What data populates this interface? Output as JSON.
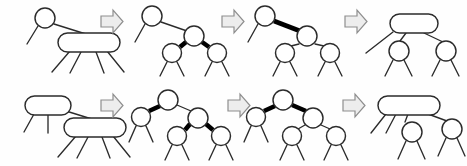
{
  "figure": {
    "background_color": "#fefefe",
    "stroke_color": "#2b2b2b",
    "red_edge_color": "#000000",
    "node_fill_color": "#ffffff",
    "arrow_fill_color": "#ededed",
    "arrow_stroke_color": "#8e8e8e",
    "rows": [
      {
        "row_name": "top-row",
        "description": "Split of a 4-node whose parent is a 2-node",
        "panels": [
          {
            "panel_name": "top-panel-1",
            "caption": "2-3-4 tree: 2-node parent with 4-node child",
            "nodes": [
              {
                "node_name": "parent-2-node",
                "shape": "circle",
                "keys": 1,
                "cx": 45,
                "cy": 18,
                "r": 10
              },
              {
                "node_name": "child-4-node",
                "shape": "rounded-rect",
                "keys": 3,
                "x": 58,
                "y": 33,
                "w": 62,
                "h": 19,
                "rx": 9.5
              }
            ],
            "edges": [
              {
                "edge_name": "parent-left-stub",
                "style": "thin"
              },
              {
                "edge_name": "parent-to-4-node",
                "style": "thin"
              },
              {
                "edge_name": "child-stub-1",
                "style": "thin"
              },
              {
                "edge_name": "child-stub-2",
                "style": "thin"
              },
              {
                "edge_name": "child-stub-3",
                "style": "thin"
              },
              {
                "edge_name": "child-stub-4",
                "style": "thin"
              }
            ]
          },
          {
            "panel_name": "top-panel-2",
            "caption": "Red-black equivalent: middle black node with two red children",
            "nodes": [
              {
                "node_name": "parent-node",
                "shape": "circle",
                "keys": 1,
                "cx": 152,
                "cy": 16,
                "r": 10
              },
              {
                "node_name": "middle-node",
                "shape": "circle",
                "keys": 1,
                "cx": 194,
                "cy": 36,
                "r": 10
              },
              {
                "node_name": "left-red-node",
                "shape": "circle",
                "keys": 1,
                "cx": 172,
                "cy": 53,
                "r": 9.5
              },
              {
                "node_name": "right-red-node",
                "shape": "circle",
                "keys": 1,
                "cx": 217,
                "cy": 53,
                "r": 9.5
              }
            ],
            "edges": [
              {
                "edge_name": "parent-left-stub",
                "style": "thin"
              },
              {
                "edge_name": "parent-to-middle",
                "style": "thin"
              },
              {
                "edge_name": "middle-to-left-red",
                "style": "thick"
              },
              {
                "edge_name": "middle-to-right-red",
                "style": "thick"
              },
              {
                "edge_name": "left-red-stub-1",
                "style": "thin"
              },
              {
                "edge_name": "left-red-stub-2",
                "style": "thin"
              },
              {
                "edge_name": "right-red-stub-1",
                "style": "thin"
              },
              {
                "edge_name": "right-red-stub-2",
                "style": "thin"
              }
            ]
          },
          {
            "panel_name": "top-panel-3",
            "caption": "Color flip: middle node becomes red, children become black",
            "nodes": [
              {
                "node_name": "parent-node",
                "shape": "circle",
                "keys": 1,
                "cx": 265,
                "cy": 16,
                "r": 10
              },
              {
                "node_name": "middle-red-node",
                "shape": "circle",
                "keys": 1,
                "cx": 307,
                "cy": 36,
                "r": 10
              },
              {
                "node_name": "left-child",
                "shape": "circle",
                "keys": 1,
                "cx": 285,
                "cy": 53,
                "r": 9.5
              },
              {
                "node_name": "right-child",
                "shape": "circle",
                "keys": 1,
                "cx": 330,
                "cy": 53,
                "r": 9.5
              }
            ],
            "edges": [
              {
                "edge_name": "parent-left-stub",
                "style": "thin"
              },
              {
                "edge_name": "parent-to-middle",
                "style": "thick"
              },
              {
                "edge_name": "middle-to-left-child",
                "style": "thin"
              },
              {
                "edge_name": "middle-to-right-child",
                "style": "thin"
              },
              {
                "edge_name": "left-child-stub-1",
                "style": "thin"
              },
              {
                "edge_name": "left-child-stub-2",
                "style": "thin"
              },
              {
                "edge_name": "right-child-stub-1",
                "style": "thin"
              },
              {
                "edge_name": "right-child-stub-2",
                "style": "thin"
              }
            ]
          },
          {
            "panel_name": "top-panel-4",
            "caption": "2-3-4 tree result: parent becomes a 3-node with two 2-node children",
            "nodes": [
              {
                "node_name": "parent-3-node",
                "shape": "rounded-rect",
                "keys": 2,
                "x": 390,
                "y": 14,
                "w": 48,
                "h": 19,
                "rx": 9.5
              },
              {
                "node_name": "left-2-node",
                "shape": "circle",
                "keys": 1,
                "cx": 399,
                "cy": 51,
                "r": 10
              },
              {
                "node_name": "right-2-node",
                "shape": "circle",
                "keys": 1,
                "cx": 446,
                "cy": 51,
                "r": 10
              }
            ],
            "edges": [
              {
                "edge_name": "parent-left-stub",
                "style": "thin"
              },
              {
                "edge_name": "parent-to-left-2-node",
                "style": "thin"
              },
              {
                "edge_name": "parent-to-right-2-node",
                "style": "thin"
              },
              {
                "edge_name": "left-2-node-stub-1",
                "style": "thin"
              },
              {
                "edge_name": "left-2-node-stub-2",
                "style": "thin"
              },
              {
                "edge_name": "right-2-node-stub-1",
                "style": "thin"
              },
              {
                "edge_name": "right-2-node-stub-2",
                "style": "thin"
              }
            ]
          }
        ],
        "arrows": [
          {
            "arrow_name": "top-arrow-1",
            "direction": "right",
            "x": 101,
            "y": 10
          },
          {
            "arrow_name": "top-arrow-2",
            "direction": "right",
            "x": 222,
            "y": 10
          },
          {
            "arrow_name": "top-arrow-3",
            "direction": "right",
            "x": 345,
            "y": 10
          }
        ]
      },
      {
        "row_name": "bottom-row",
        "description": "Split of a 4-node whose parent is a 3-node",
        "panels": [
          {
            "panel_name": "bottom-panel-1",
            "caption": "2-3-4 tree: 3-node parent with 4-node child",
            "nodes": [
              {
                "node_name": "parent-3-node",
                "shape": "rounded-rect",
                "keys": 2,
                "x": 25,
                "y": 96,
                "w": 46,
                "h": 19,
                "rx": 9.5
              },
              {
                "node_name": "child-4-node",
                "shape": "rounded-rect",
                "keys": 3,
                "x": 64,
                "y": 118,
                "w": 62,
                "h": 19,
                "rx": 9.5
              }
            ],
            "edges": [
              {
                "edge_name": "parent-stub-1",
                "style": "thin"
              },
              {
                "edge_name": "parent-stub-2",
                "style": "thin"
              },
              {
                "edge_name": "parent-to-4-node",
                "style": "thin"
              },
              {
                "edge_name": "child-stub-1",
                "style": "thin"
              },
              {
                "edge_name": "child-stub-2",
                "style": "thin"
              },
              {
                "edge_name": "child-stub-3",
                "style": "thin"
              },
              {
                "edge_name": "child-stub-4",
                "style": "thin"
              }
            ]
          },
          {
            "panel_name": "bottom-panel-2",
            "caption": "Red-black equivalent: root with one red left child and a black right child holding two red children",
            "nodes": [
              {
                "node_name": "root-node",
                "shape": "circle",
                "keys": 1,
                "cx": 168,
                "cy": 100,
                "r": 10
              },
              {
                "node_name": "left-red-node",
                "shape": "circle",
                "keys": 1,
                "cx": 141,
                "cy": 117,
                "r": 9.5
              },
              {
                "node_name": "right-node",
                "shape": "circle",
                "keys": 1,
                "cx": 198,
                "cy": 118,
                "r": 10
              },
              {
                "node_name": "grandchild-left-red",
                "shape": "circle",
                "keys": 1,
                "cx": 177,
                "cy": 136,
                "r": 9.5
              },
              {
                "node_name": "grandchild-right-red",
                "shape": "circle",
                "keys": 1,
                "cx": 221,
                "cy": 136,
                "r": 9.5
              }
            ],
            "edges": [
              {
                "edge_name": "root-to-left-red",
                "style": "thick"
              },
              {
                "edge_name": "root-to-right",
                "style": "thin"
              },
              {
                "edge_name": "right-to-grandchild-left",
                "style": "thick"
              },
              {
                "edge_name": "right-to-grandchild-right",
                "style": "thick"
              },
              {
                "edge_name": "left-red-stub-1",
                "style": "thin"
              },
              {
                "edge_name": "left-red-stub-2",
                "style": "thin"
              },
              {
                "edge_name": "grandchild-left-stub-1",
                "style": "thin"
              },
              {
                "edge_name": "grandchild-left-stub-2",
                "style": "thin"
              },
              {
                "edge_name": "grandchild-right-stub-1",
                "style": "thin"
              },
              {
                "edge_name": "grandchild-right-stub-2",
                "style": "thin"
              }
            ]
          },
          {
            "panel_name": "bottom-panel-3",
            "caption": "Color flip: both children of root become red",
            "nodes": [
              {
                "node_name": "root-node",
                "shape": "circle",
                "keys": 1,
                "cx": 283,
                "cy": 100,
                "r": 10
              },
              {
                "node_name": "left-red-node",
                "shape": "circle",
                "keys": 1,
                "cx": 256,
                "cy": 117,
                "r": 9.5
              },
              {
                "node_name": "right-red-node",
                "shape": "circle",
                "keys": 1,
                "cx": 313,
                "cy": 118,
                "r": 10
              },
              {
                "node_name": "grandchild-left",
                "shape": "circle",
                "keys": 1,
                "cx": 292,
                "cy": 136,
                "r": 9.5
              },
              {
                "node_name": "grandchild-right",
                "shape": "circle",
                "keys": 1,
                "cx": 336,
                "cy": 136,
                "r": 9.5
              }
            ],
            "edges": [
              {
                "edge_name": "root-to-left-red",
                "style": "thick"
              },
              {
                "edge_name": "root-to-right-red",
                "style": "thick"
              },
              {
                "edge_name": "right-to-grandchild-left",
                "style": "thin"
              },
              {
                "edge_name": "right-to-grandchild-right",
                "style": "thin"
              },
              {
                "edge_name": "left-red-stub-1",
                "style": "thin"
              },
              {
                "edge_name": "left-red-stub-2",
                "style": "thin"
              },
              {
                "edge_name": "grandchild-left-stub-1",
                "style": "thin"
              },
              {
                "edge_name": "grandchild-left-stub-2",
                "style": "thin"
              },
              {
                "edge_name": "grandchild-right-stub-1",
                "style": "thin"
              },
              {
                "edge_name": "grandchild-right-stub-2",
                "style": "thin"
              }
            ]
          },
          {
            "panel_name": "bottom-panel-4",
            "caption": "2-3-4 tree result: parent becomes a 4-node with two 2-node children",
            "nodes": [
              {
                "node_name": "parent-4-node",
                "shape": "rounded-rect",
                "keys": 3,
                "x": 378,
                "y": 96,
                "w": 62,
                "h": 19,
                "rx": 9.5
              },
              {
                "node_name": "left-2-node",
                "shape": "circle",
                "keys": 1,
                "cx": 412,
                "cy": 132,
                "r": 10
              },
              {
                "node_name": "right-2-node",
                "shape": "circle",
                "keys": 1,
                "cx": 452,
                "cy": 129,
                "r": 10
              }
            ],
            "edges": [
              {
                "edge_name": "parent-stub-1",
                "style": "thin"
              },
              {
                "edge_name": "parent-stub-2",
                "style": "thin"
              },
              {
                "edge_name": "parent-stub-3",
                "style": "thin"
              },
              {
                "edge_name": "parent-to-right-2-node",
                "style": "thin"
              },
              {
                "edge_name": "left-2-node-stub-1",
                "style": "thin"
              },
              {
                "edge_name": "left-2-node-stub-2",
                "style": "thin"
              },
              {
                "edge_name": "right-2-node-stub-1",
                "style": "thin"
              },
              {
                "edge_name": "right-2-node-stub-2",
                "style": "thin"
              }
            ]
          }
        ],
        "arrows": [
          {
            "arrow_name": "bottom-arrow-1",
            "direction": "right",
            "x": 101,
            "y": 94
          },
          {
            "arrow_name": "bottom-arrow-2",
            "direction": "right",
            "x": 228,
            "y": 94
          },
          {
            "arrow_name": "bottom-arrow-3",
            "direction": "right",
            "x": 343,
            "y": 94
          }
        ]
      }
    ]
  }
}
